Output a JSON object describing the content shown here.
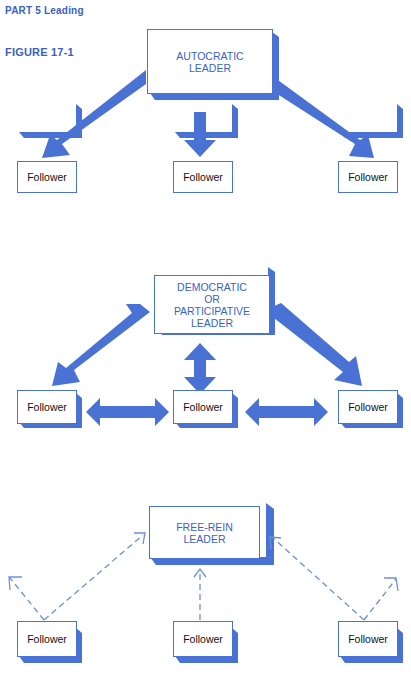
{
  "header": {
    "part": "PART 5   Leading",
    "figure": "FIGURE 17-1"
  },
  "colors": {
    "accent": "#4a72d4",
    "leader_text": "#3a62cc",
    "header_text": "#3a5fc0"
  },
  "panels": [
    {
      "leader": [
        "AUTOCRATIC",
        "LEADER"
      ],
      "followers": [
        "Follower",
        "Follower",
        "Follower"
      ],
      "arrow_style": "solid one-way leader-to-follower"
    },
    {
      "leader": [
        "DEMOCRATIC",
        "OR",
        "PARTICIPATIVE",
        "LEADER"
      ],
      "followers": [
        "Follower",
        "Follower",
        "Follower"
      ],
      "arrow_style": "solid two-way, leader-follower and follower-follower"
    },
    {
      "leader": [
        "FREE-REIN",
        "LEADER"
      ],
      "followers": [
        "Follower",
        "Follower",
        "Follower"
      ],
      "arrow_style": "dashed one-way follower outward"
    }
  ]
}
